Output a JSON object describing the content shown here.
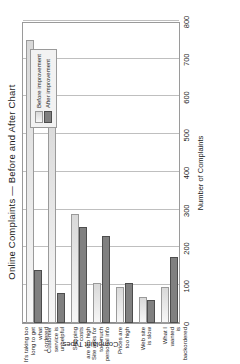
{
  "chart_data": {
    "type": "bar",
    "title": "Online Complaints — Before and After Chart",
    "xlabel": "Complaint Types",
    "ylabel": "Number of Complaints",
    "ylim": [
      0,
      800
    ],
    "ytick_step": 100,
    "yticks": [
      "0",
      "100",
      "200",
      "300",
      "400",
      "500",
      "600",
      "700",
      "800"
    ],
    "grid": true,
    "legend_position": "top-right",
    "orientation": "horizontal-bars-rotated",
    "categories": [
      "It's taking too long to get what I ordered",
      "Customer service is unhelpful",
      "Shipping costs are too high",
      "Site asks for too much personal info",
      "Prices are too high",
      "Web site is slow",
      "What I wanted is backordered"
    ],
    "category_lines": [
      [
        "It's taking too",
        "long to get what",
        "I ordered"
      ],
      [
        "Customer",
        "service is",
        "unhelpful"
      ],
      [
        "Shipping costs",
        "are too high"
      ],
      [
        "Site asks for",
        "too much",
        "personal info"
      ],
      [
        "Prices are",
        "too high"
      ],
      [
        "Web site",
        "is slow"
      ],
      [
        "What I wanted",
        "is backordered"
      ]
    ],
    "series": [
      {
        "name": "Before improvement",
        "color": "#e0e0e0",
        "values": [
          750,
          560,
          290,
          105,
          95,
          70,
          95
        ]
      },
      {
        "name": "After improvement",
        "color": "#808080",
        "values": [
          140,
          80,
          255,
          230,
          105,
          60,
          175
        ]
      }
    ]
  },
  "legend": {
    "entries": [
      {
        "label": "Before improvement"
      },
      {
        "label": "After improvement"
      }
    ]
  }
}
